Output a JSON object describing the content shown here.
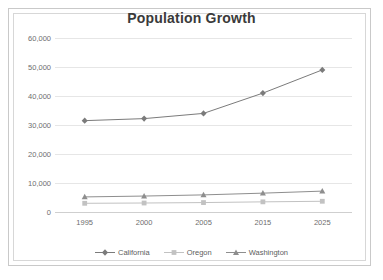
{
  "chart_data": {
    "type": "line",
    "title": "Population Growth",
    "xlabel": "",
    "ylabel": "",
    "categories": [
      "1995",
      "2000",
      "2005",
      "2015",
      "2025"
    ],
    "series": [
      {
        "name": "California",
        "marker": "diamond",
        "color": "#7b7b7b",
        "values": [
          31500,
          32200,
          34000,
          41000,
          49000
        ]
      },
      {
        "name": "Oregon",
        "marker": "square",
        "color": "#c2c2c2",
        "values": [
          3000,
          3100,
          3250,
          3500,
          3700
        ]
      },
      {
        "name": "Washington",
        "marker": "triangle",
        "color": "#8e8e8e",
        "values": [
          5200,
          5500,
          5900,
          6500,
          7200
        ]
      }
    ],
    "ylim": [
      0,
      60000
    ],
    "y_ticks": [
      "0",
      "10,000",
      "20,000",
      "30,000",
      "40,000",
      "50,000",
      "60,000"
    ],
    "y_tick_values": [
      0,
      10000,
      20000,
      30000,
      40000,
      50000,
      60000
    ],
    "grid": true,
    "legend_position": "bottom"
  },
  "legend": {
    "items": [
      {
        "label": "California"
      },
      {
        "label": "Oregon"
      },
      {
        "label": "Washington"
      }
    ]
  },
  "colors": {
    "grid": "#e6e6e6",
    "axis": "#cfcfcf",
    "title": "#3a3a3a",
    "tick_text": "#6e6e6e",
    "frame": "#c9c9c9"
  }
}
